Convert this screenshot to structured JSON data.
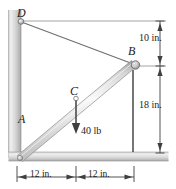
{
  "figure": {
    "colors": {
      "line": "#5a5a5a",
      "text": "#1b1b1b",
      "hatch_light": "#e9e9e9",
      "hatch_dark": "#b4b4b4",
      "member_light": "#f2f2f2",
      "member_mid": "#c9c9c9"
    }
  },
  "points": {
    "a": {
      "label": "A"
    },
    "b": {
      "label": "B"
    },
    "c": {
      "label": "C"
    },
    "d": {
      "label": "D"
    }
  },
  "load": {
    "label": "40 lb",
    "magnitude": 40,
    "units": "lb",
    "direction": "down",
    "applied_at": "C"
  },
  "dimensions": {
    "vertical_upper": "10 in.",
    "vertical_lower": "18 in.",
    "horizontal_left": "12 in.",
    "horizontal_right": "12 in."
  }
}
